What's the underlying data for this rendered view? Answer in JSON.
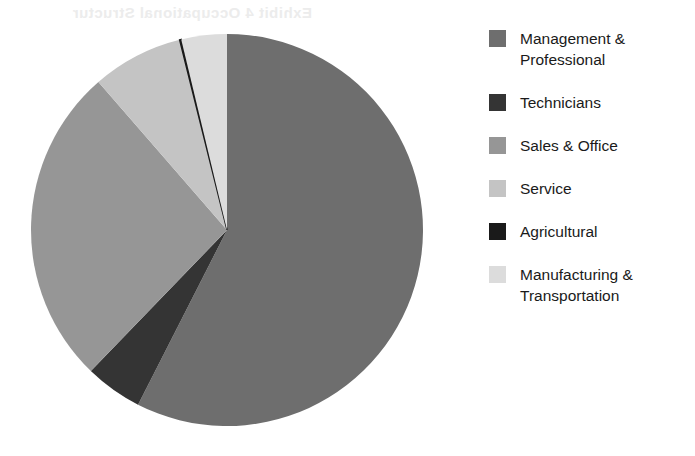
{
  "artifact": {
    "bleed_text": "Exhibit 4 Occupational Structure"
  },
  "chart_data": {
    "type": "pie",
    "title": "",
    "subtitle": "",
    "xlabel": "",
    "ylabel": "",
    "legend_position": "right",
    "grid": false,
    "start_angle_deg": 0,
    "direction": "clockwise",
    "center": {
      "x": 227,
      "y": 230
    },
    "radius": 196,
    "categories": [
      "Management & Professional",
      "Technicians",
      "Sales & Office",
      "Service",
      "Agricultural",
      "Manufacturing & Transportation"
    ],
    "values": [
      57.5,
      4.7,
      26.4,
      7.5,
      0.1,
      3.8
    ],
    "angles_deg": [
      207.0,
      17.0,
      95.0,
      27.0,
      0.5,
      13.5
    ],
    "colors": [
      "#6e6e6e",
      "#343434",
      "#969696",
      "#c4c4c4",
      "#1a1a1a",
      "#dcdcdc"
    ],
    "slices": [
      {
        "label": "Management & Professional",
        "value": 57.5,
        "angle_deg": 207.0,
        "start_deg": 0.0,
        "end_deg": 207.0,
        "color": "#6e6e6e"
      },
      {
        "label": "Technicians",
        "value": 4.7,
        "angle_deg": 17.0,
        "start_deg": 207.0,
        "end_deg": 224.0,
        "color": "#343434"
      },
      {
        "label": "Sales & Office",
        "value": 26.4,
        "angle_deg": 95.0,
        "start_deg": 224.0,
        "end_deg": 319.0,
        "color": "#969696"
      },
      {
        "label": "Service",
        "value": 7.5,
        "angle_deg": 27.0,
        "start_deg": 319.0,
        "end_deg": 346.0,
        "color": "#c4c4c4"
      },
      {
        "label": "Agricultural",
        "value": 0.1,
        "angle_deg": 0.5,
        "start_deg": 346.0,
        "end_deg": 346.5,
        "color": "#1a1a1a"
      },
      {
        "label": "Manufacturing & Transportation",
        "value": 3.8,
        "angle_deg": 13.5,
        "start_deg": 346.5,
        "end_deg": 360.0,
        "color": "#dcdcdc"
      }
    ]
  },
  "legend": {
    "items": [
      {
        "label": "Management & Professional",
        "color": "#6e6e6e"
      },
      {
        "label": "Technicians",
        "color": "#343434"
      },
      {
        "label": "Sales & Office",
        "color": "#969696"
      },
      {
        "label": "Service",
        "color": "#c4c4c4"
      },
      {
        "label": "Agricultural",
        "color": "#1a1a1a"
      },
      {
        "label": "Manufacturing & Transportation",
        "color": "#dcdcdc"
      }
    ]
  }
}
